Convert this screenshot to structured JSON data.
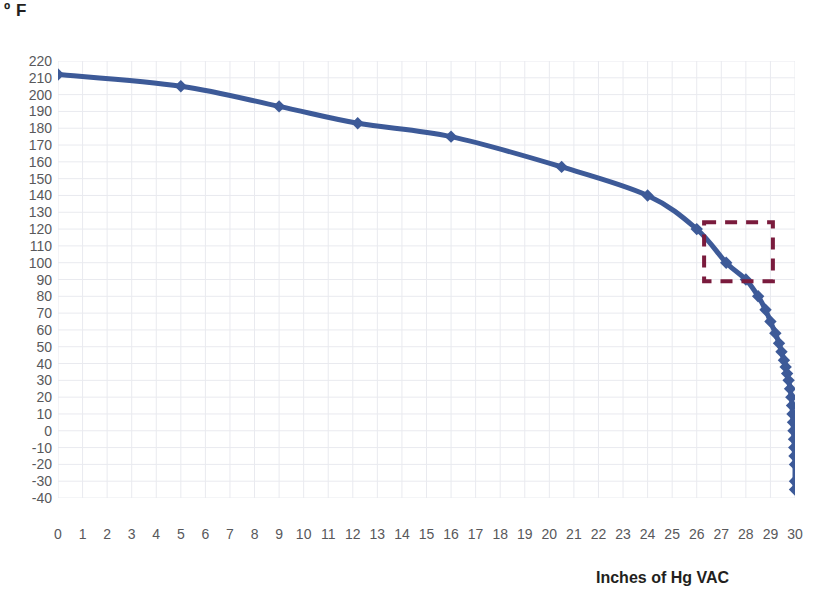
{
  "chart_data": {
    "type": "line",
    "title": "",
    "subtitle": "",
    "xlabel": "Inches of Hg VAC",
    "ylabel": "º F",
    "xlim": [
      0,
      30
    ],
    "ylim": [
      -40,
      220
    ],
    "x_ticks": [
      0,
      1,
      2,
      3,
      4,
      5,
      6,
      7,
      8,
      9,
      10,
      11,
      12,
      13,
      14,
      15,
      16,
      17,
      18,
      19,
      20,
      21,
      22,
      23,
      24,
      25,
      26,
      27,
      28,
      29,
      30
    ],
    "y_ticks": [
      220,
      210,
      200,
      190,
      180,
      170,
      160,
      150,
      140,
      130,
      120,
      110,
      100,
      90,
      80,
      70,
      60,
      50,
      40,
      30,
      20,
      10,
      0,
      -10,
      -20,
      -30,
      -40
    ],
    "grid": true,
    "legend": null,
    "series": [
      {
        "name": "Boiling point of water under vacuum",
        "color": "#3d5a98",
        "marker": "diamond",
        "x": [
          0,
          5,
          9,
          12.2,
          16,
          20.5,
          24,
          26,
          27.2,
          28,
          28.5,
          28.8,
          29.0,
          29.2,
          29.35,
          29.45,
          29.55,
          29.62,
          29.68,
          29.74,
          29.8,
          29.85,
          29.88,
          29.9,
          29.92,
          29.94,
          29.96,
          29.97,
          29.98,
          30,
          30,
          30
        ],
        "y": [
          212,
          205,
          193,
          183,
          175,
          157,
          140,
          120,
          100,
          90,
          80,
          72,
          65,
          58,
          52,
          47,
          42,
          38,
          34,
          30,
          25,
          20,
          15,
          10,
          5,
          0,
          -5,
          -10,
          -15,
          -20,
          -30,
          -35
        ]
      }
    ],
    "annotations": [
      {
        "type": "dashed-rectangle",
        "name": "highlight-box",
        "color": "#7a1b3d",
        "x0": 26.3,
        "x1": 29.1,
        "y0": 89,
        "y1": 124
      }
    ]
  },
  "axes": {
    "y_title": "º F",
    "x_title": "Inches of Hg VAC"
  },
  "colors": {
    "line": "#3d5a98",
    "marker": "#3d5a98",
    "grid": "#e9eaef",
    "tick_text": "#58585b",
    "axis_title": "#231f20",
    "highlight_box": "#7a1b3d",
    "background": "#ffffff"
  }
}
